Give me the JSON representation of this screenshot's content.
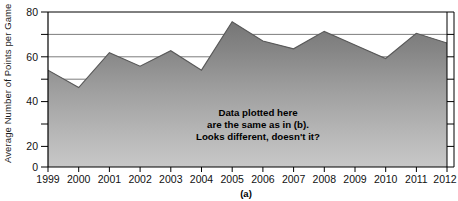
{
  "figure": {
    "panel_label": "(a)",
    "annotation": [
      "Data plotted here",
      "are the same as in (b).",
      "Looks different, doesn't it?"
    ],
    "annotation_text": "Data plotted here are the same as in (b). Looks different, doesn't it?"
  },
  "colors": {
    "fill_top": "#7f7f7f",
    "fill_bottom": "#c4c4c4",
    "line": "#4d4d4d",
    "axis": "#000000",
    "grid": "#6e6e6e",
    "text": "#111111",
    "background": "#ffffff"
  },
  "chart_data": {
    "type": "area",
    "title": "",
    "subtitle": "",
    "xlabel": "",
    "ylabel": "Average Number of Points per Game",
    "categories": [
      "1999",
      "2000",
      "2001",
      "2002",
      "2003",
      "2004",
      "2005",
      "2006",
      "2007",
      "2008",
      "2009",
      "2010",
      "2011",
      "2012"
    ],
    "x": [
      1999,
      2000,
      2001,
      2002,
      2003,
      2004,
      2005,
      2006,
      2007,
      2008,
      2009,
      2010,
      2011,
      2012
    ],
    "values": [
      50,
      41,
      59,
      52,
      60,
      50,
      75,
      65,
      61,
      70,
      63,
      56,
      69,
      64
    ],
    "series": [
      {
        "name": "Average Number of Points per Game",
        "values": [
          50,
          41,
          59,
          52,
          60,
          50,
          75,
          65,
          61,
          70,
          63,
          56,
          69,
          64
        ]
      }
    ],
    "ylim": [
      0,
      80
    ],
    "xlim": [
      1999,
      2012
    ],
    "yticks": [
      0,
      20,
      40,
      60,
      80
    ],
    "ytick_labels": [
      "0",
      "20",
      "40",
      "60",
      "80"
    ],
    "yticks_minor": [
      10,
      30,
      50,
      70
    ],
    "gridlines": [
      60,
      70,
      80
    ],
    "grid": true,
    "legend": "none",
    "legend_position": "none",
    "annotations": [
      {
        "text": "Data plotted here are the same as in (b). Looks different, doesn't it?",
        "x": 2007,
        "y": 22
      }
    ],
    "note": "Y axis truncated appearance; area chart filled with vertical gray gradient."
  },
  "yaxis": {
    "title": "Average Number of Points per Game",
    "labels": [
      "80",
      "60",
      "40",
      "20",
      "0"
    ]
  },
  "xaxis": {
    "labels": [
      "1999",
      "2000",
      "2001",
      "2002",
      "2003",
      "2004",
      "2005",
      "2006",
      "2007",
      "2008",
      "2009",
      "2010",
      "2011",
      "2012"
    ]
  }
}
